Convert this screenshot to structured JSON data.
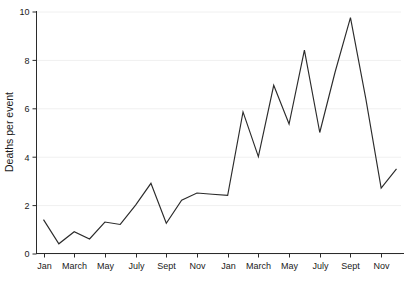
{
  "chart_data": {
    "type": "line",
    "title": "",
    "subtitle": "",
    "xlabel": "",
    "ylabel": "Deaths per event",
    "ylim": [
      0,
      10
    ],
    "yticks": [
      0,
      2,
      4,
      6,
      8,
      10
    ],
    "ytick_labels": [
      "0",
      "2",
      "4",
      "6",
      "8",
      "10"
    ],
    "grid": true,
    "grid_axis": "y",
    "legend": false,
    "legend_position": "none",
    "line_color": "#2b2b2b",
    "background_color": "#ffffff",
    "grid_color": "#f0f0f0",
    "axis_color": "#2b2b2b",
    "x_tick_labels": [
      "Jan",
      "March",
      "May",
      "July",
      "Sept",
      "Nov",
      "Jan",
      "March",
      "May",
      "July",
      "Sept",
      "Nov"
    ],
    "x_tick_indices": [
      0,
      2,
      4,
      6,
      8,
      10,
      12,
      14,
      16,
      18,
      20,
      22
    ],
    "x": [
      0,
      1,
      2,
      3,
      4,
      5,
      6,
      7,
      8,
      9,
      10,
      11,
      12,
      13,
      14,
      15,
      16,
      17,
      18,
      19,
      20,
      21,
      22,
      23
    ],
    "categories": [
      "Jan",
      "Feb",
      "March",
      "April",
      "May",
      "June",
      "July",
      "Aug",
      "Sept",
      "Oct",
      "Nov",
      "Dec",
      "Jan",
      "Feb",
      "March",
      "April",
      "May",
      "June",
      "July",
      "Aug",
      "Sept",
      "Oct",
      "Nov",
      "Dec"
    ],
    "values": [
      1.4,
      0.4,
      0.9,
      0.6,
      1.3,
      1.2,
      2.0,
      2.9,
      1.25,
      2.2,
      2.5,
      2.45,
      2.4,
      5.85,
      4.0,
      6.95,
      5.35,
      8.4,
      5.0,
      7.5,
      9.75,
      6.4,
      2.7,
      3.5
    ]
  }
}
